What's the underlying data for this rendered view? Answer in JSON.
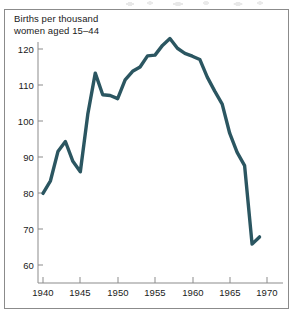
{
  "figure": {
    "axis_label_line1": "Births per thousand",
    "axis_label_line2": "women aged 15–44",
    "axis_label": "Births per thousand\nwomen aged 15–44",
    "line_color": "#2b5661",
    "frame_color": "#8b8b8b",
    "text_color": "#1a1a1a",
    "background_color": "#ffffff"
  },
  "chart_data": {
    "type": "line",
    "title": "",
    "subtitle": "",
    "xlabel": "",
    "ylabel": "Births per thousand women aged 15–44",
    "xlim": [
      1939,
      1970.5
    ],
    "ylim": [
      57,
      126
    ],
    "grid": false,
    "legend": "none",
    "x_ticks": [
      1940,
      1945,
      1950,
      1955,
      1960,
      1965,
      1970
    ],
    "x_tick_labels": [
      "1940",
      "1945",
      "1950",
      "1955",
      "1960",
      "1965",
      "1970"
    ],
    "y_ticks": [
      60,
      70,
      80,
      90,
      100,
      110,
      120
    ],
    "y_tick_labels": [
      "60",
      "70",
      "80",
      "90",
      "100",
      "110",
      "120"
    ],
    "series": [
      {
        "name": "Births per thousand women aged 15–44",
        "color": "#2b5661",
        "x": [
          1940,
          1941,
          1942,
          1943,
          1944,
          1945,
          1946,
          1947,
          1948,
          1949,
          1950,
          1951,
          1952,
          1953,
          1954,
          1955,
          1956,
          1957,
          1958,
          1959,
          1960,
          1961,
          1962,
          1963,
          1964,
          1965,
          1966,
          1967,
          1968,
          1969
        ],
        "values": [
          79.9,
          83.4,
          91.5,
          94.3,
          88.8,
          85.9,
          101.9,
          113.3,
          107.3,
          107.1,
          106.2,
          111.4,
          113.8,
          115.0,
          118.1,
          118.3,
          121.0,
          122.9,
          120.2,
          118.8,
          118.0,
          117.1,
          112.2,
          108.3,
          104.7,
          96.6,
          91.3,
          87.6,
          65.8,
          67.8
        ]
      }
    ]
  },
  "ytick_positions": {
    "120": 49,
    "110": 85,
    "100": 121,
    "90": 157,
    "80": 193,
    "70": 229,
    "60": 265
  },
  "xtick_positions": {
    "1940": 43,
    "1945": 80,
    "1950": 118,
    "1955": 155,
    "1960": 193,
    "1965": 230,
    "1970": 267
  }
}
